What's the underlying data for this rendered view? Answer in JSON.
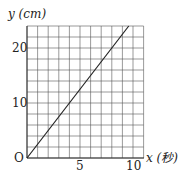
{
  "chart_data": {
    "type": "line",
    "title": "",
    "xlabel": "x (秒)",
    "ylabel": "y (cm)",
    "xlim": [
      0,
      11
    ],
    "ylim": [
      0,
      24
    ],
    "grid": true,
    "x_ticks": [
      "5",
      "10"
    ],
    "y_ticks": [
      "10",
      "20"
    ],
    "origin_label": "O",
    "series": [
      {
        "name": "y = 2.5x",
        "x": [
          0,
          4,
          8,
          9.6
        ],
        "y": [
          0,
          10,
          20,
          24
        ]
      }
    ]
  },
  "labels": {
    "y_axis": "y (cm)",
    "x_axis": "x (秒)",
    "origin": "O",
    "x5": "5",
    "x10": "10",
    "y10": "10",
    "y20": "20"
  }
}
